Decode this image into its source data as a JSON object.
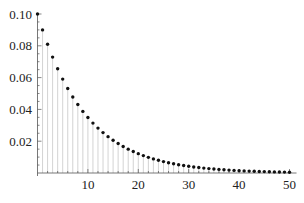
{
  "chart_data": {
    "type": "scatter",
    "style": "stem-plot (points with light vertical drop lines)",
    "title": "",
    "xlabel": "",
    "ylabel": "",
    "x": [
      0,
      1,
      2,
      3,
      4,
      5,
      6,
      7,
      8,
      9,
      10,
      11,
      12,
      13,
      14,
      15,
      16,
      17,
      18,
      19,
      20,
      21,
      22,
      23,
      24,
      25,
      26,
      27,
      28,
      29,
      30,
      31,
      32,
      33,
      34,
      35,
      36,
      37,
      38,
      39,
      40,
      41,
      42,
      43,
      44,
      45,
      46,
      47,
      48,
      49,
      50
    ],
    "values": [
      0.1,
      0.09,
      0.081,
      0.0729,
      0.06561,
      0.059049,
      0.0531441,
      0.04782969,
      0.043046721,
      0.0387420489,
      0.03486784401,
      0.031381059609,
      0.0282429536481,
      0.02541865828329,
      0.022876792454961,
      0.0205891132094649,
      0.0185302018885184,
      0.0166771816996666,
      0.0150094635296999,
      0.0135085171767299,
      0.0121576654590569,
      0.0109418989131512,
      0.00984770902183611,
      0.0088629381196525,
      0.00797664430768725,
      0.00717897987691853,
      0.00646108188922667,
      0.00581497370030401,
      0.00523347633027361,
      0.00471012869724625,
      0.00423911582752162,
      0.00381520424476946,
      0.00343368382029251,
      0.00309031543826326,
      0.00278128389443694,
      0.00250315550499324,
      0.00225283995449392,
      0.00202755595904453,
      0.00182480036314008,
      0.00164232032682607,
      0.00147808829414346,
      0.00133027946472912,
      0.00119725151825621,
      0.00107752636643059,
      0.000969773729787528,
      0.000872796356808775,
      0.000785516721127898,
      0.000706965049015108,
      0.000635268544113597,
      0.000572241689702238,
      0.000515377520732014
    ],
    "xlim": [
      0,
      51
    ],
    "ylim": [
      0,
      0.1
    ],
    "x_ticks": [
      10,
      20,
      30,
      40,
      50
    ],
    "x_tick_labels": [
      "10",
      "20",
      "30",
      "40",
      "50"
    ],
    "y_ticks": [
      0.02,
      0.04,
      0.06,
      0.08,
      0.1
    ],
    "y_tick_labels": [
      "0.02",
      "0.04",
      "0.06",
      "0.08",
      "0.10"
    ],
    "grid": false,
    "legend": null,
    "colors": {
      "points": "#111111",
      "stems": "#c8c8c8",
      "axes": "#555555"
    }
  }
}
